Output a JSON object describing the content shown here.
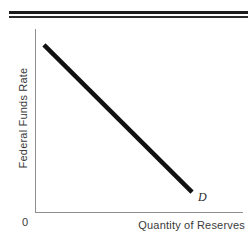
{
  "figure": {
    "ylabel": "Federal Funds Rate",
    "xlabel": "Quantity of Reserves",
    "origin_label": "0",
    "curve_label": "D"
  },
  "colors": {
    "curve": "#111111",
    "axis": "#8e8e8e",
    "text": "#3a3a3a",
    "rule": "#1c1c1c",
    "background": "#ffffff"
  },
  "chart_data": {
    "type": "line",
    "title": "",
    "xlabel": "Quantity of Reserves",
    "ylabel": "Federal Funds Rate",
    "xlim": [
      0,
      1
    ],
    "ylim": [
      0,
      1
    ],
    "grid": false,
    "legend": "none",
    "series": [
      {
        "name": "D",
        "label": "D",
        "annotation": "D",
        "x": [
          0.043,
          0.755
        ],
        "y": [
          0.913,
          0.109
        ],
        "linewidth": 4,
        "color": "#111111"
      }
    ],
    "xticks": [],
    "yticks": [],
    "xticklabels": [],
    "yticklabels": [],
    "annotations": [
      {
        "text": "D",
        "x": 0.785,
        "y": 0.035,
        "style": "italic"
      },
      {
        "text": "0",
        "x": -0.06,
        "y": -0.06,
        "style": "normal"
      }
    ]
  }
}
